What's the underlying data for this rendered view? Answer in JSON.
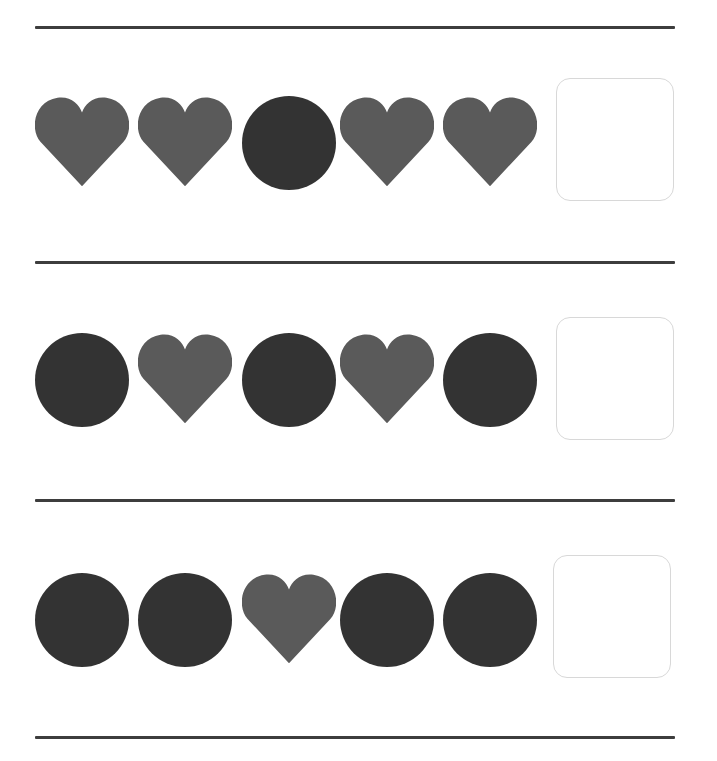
{
  "worksheet": {
    "colors": {
      "heart": "#5a5a5a",
      "circle": "#333333",
      "divider": "#3d3d3d",
      "box_border": "#d8d8d8"
    },
    "dividers_y": [
      26,
      261,
      499,
      736
    ],
    "rows": [
      {
        "top": 96,
        "sequence": [
          "heart-icon",
          "heart-icon",
          "circle-icon",
          "heart-icon",
          "heart-icon"
        ],
        "answer_box": {
          "x": 556,
          "y": 78,
          "value": ""
        }
      },
      {
        "top": 333,
        "sequence": [
          "circle-icon",
          "heart-icon",
          "circle-icon",
          "heart-icon",
          "circle-icon"
        ],
        "answer_box": {
          "x": 556,
          "y": 317,
          "value": ""
        }
      },
      {
        "top": 573,
        "sequence": [
          "circle-icon",
          "circle-icon",
          "heart-icon",
          "circle-icon",
          "circle-icon"
        ],
        "answer_box": {
          "x": 553,
          "y": 555,
          "value": ""
        }
      }
    ]
  }
}
